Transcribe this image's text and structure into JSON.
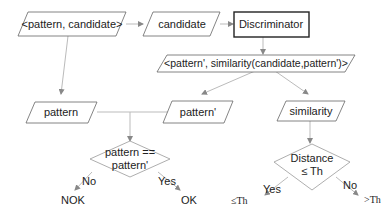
{
  "diagram": {
    "nodes": {
      "input_pair": {
        "label": "<pattern, candidate>",
        "shape": "parallelogram"
      },
      "candidate": {
        "label": "candidate",
        "shape": "parallelogram"
      },
      "discriminator": {
        "label": "Discriminator",
        "shape": "rectangle"
      },
      "output_pair": {
        "label": "<pattern', similarity(candidate,pattern')>",
        "shape": "parallelogram"
      },
      "pattern": {
        "label": "pattern",
        "shape": "parallelogram"
      },
      "pattern_prime": {
        "label": "pattern'",
        "shape": "parallelogram"
      },
      "similarity": {
        "label": "similarity",
        "shape": "parallelogram"
      },
      "decision_equal": {
        "line1": "pattern ==",
        "line2": "pattern'",
        "shape": "diamond"
      },
      "decision_distance": {
        "line1": "Distance",
        "line2": "≤ Th",
        "shape": "diamond"
      }
    },
    "branches": {
      "equal_no": "No",
      "equal_yes": "Yes",
      "distance_yes": "Yes",
      "distance_no": "No"
    },
    "outcomes": {
      "nok": "NOK",
      "ok": "OK",
      "le_th": "≤Th",
      "gt_th": ">Th"
    },
    "colors": {
      "box_border": "#555555",
      "discriminator_border": "#222222",
      "arrow": "#999999",
      "text": "#222222"
    }
  }
}
